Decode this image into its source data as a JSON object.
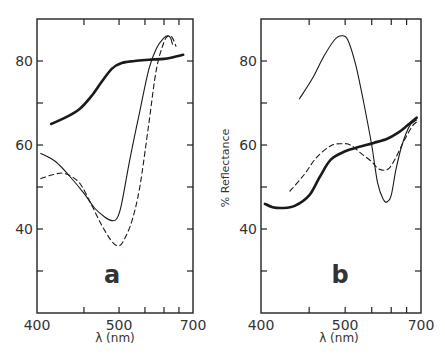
{
  "figure": {
    "ylabel": "% Reflectance",
    "xlabel": "λ (nm)"
  },
  "chart_data": [
    {
      "type": "line",
      "panel_label": "a",
      "xlabel": "λ (nm)",
      "ylabel": "",
      "x_ticks": [
        400,
        450,
        500,
        550,
        600,
        650,
        700
      ],
      "x_tick_labels": [
        "400",
        "",
        "500",
        "",
        "",
        "",
        "700"
      ],
      "x_scale_fractions": [
        0,
        0.301,
        0.526,
        0.692,
        0.814,
        0.91,
        1.0
      ],
      "y_ticks": [
        30,
        40,
        50,
        60,
        70,
        80
      ],
      "y_tick_labels": [
        "",
        "40",
        "",
        "60",
        "",
        "80"
      ],
      "ylim": [
        20,
        90
      ],
      "xlim": [
        400,
        700
      ],
      "grid": false,
      "legend": null,
      "series": [
        {
          "name": "thick-solid",
          "style": "thick",
          "points": [
            [
              415,
              65
            ],
            [
              430,
              66.5
            ],
            [
              445,
              68.5
            ],
            [
              460,
              71.5
            ],
            [
              475,
              75
            ],
            [
              490,
              78.2
            ],
            [
              505,
              79.5
            ],
            [
              530,
              80
            ],
            [
              560,
              80.3
            ],
            [
              600,
              80.5
            ],
            [
              630,
              80.9
            ],
            [
              665,
              81.5
            ]
          ]
        },
        {
          "name": "thin-solid",
          "style": "thin",
          "points": [
            [
              404,
              58
            ],
            [
              420,
              56
            ],
            [
              435,
              52.5
            ],
            [
              450,
              48.5
            ],
            [
              465,
              45
            ],
            [
              480,
              42.8
            ],
            [
              490,
              42
            ],
            [
              497,
              42.5
            ],
            [
              505,
              46
            ],
            [
              520,
              56
            ],
            [
              540,
              68
            ],
            [
              560,
              78
            ],
            [
              580,
              83
            ],
            [
              600,
              85.5
            ],
            [
              612,
              86
            ],
            [
              622,
              85.5
            ],
            [
              628,
              84
            ]
          ]
        },
        {
          "name": "dashed",
          "style": "dashed",
          "points": [
            [
              404,
              52
            ],
            [
              418,
              53
            ],
            [
              430,
              53.2
            ],
            [
              445,
              51
            ],
            [
              460,
              46
            ],
            [
              475,
              41
            ],
            [
              490,
              37
            ],
            [
              500,
              36
            ],
            [
              510,
              37.5
            ],
            [
              525,
              42
            ],
            [
              540,
              50
            ],
            [
              560,
              65
            ],
            [
              580,
              78
            ],
            [
              600,
              84.5
            ],
            [
              615,
              86
            ],
            [
              628,
              85.5
            ],
            [
              640,
              83.5
            ]
          ]
        }
      ]
    },
    {
      "type": "line",
      "panel_label": "b",
      "xlabel": "λ (nm)",
      "ylabel": "% Reflectance",
      "x_ticks": [
        400,
        450,
        500,
        550,
        600,
        650,
        700
      ],
      "x_tick_labels": [
        "400",
        "",
        "500",
        "",
        "",
        "",
        "700"
      ],
      "x_scale_fractions": [
        0,
        0.301,
        0.526,
        0.692,
        0.814,
        0.91,
        1.0
      ],
      "y_ticks": [
        30,
        40,
        50,
        60,
        70,
        80
      ],
      "y_tick_labels": [
        "",
        "40",
        "",
        "60",
        "",
        "80"
      ],
      "ylim": [
        20,
        90
      ],
      "xlim": [
        400,
        700
      ],
      "grid": false,
      "legend": null,
      "series": [
        {
          "name": "thin-solid",
          "style": "thin",
          "points": [
            [
              440,
              71
            ],
            [
              455,
              76
            ],
            [
              470,
              81
            ],
            [
              485,
              85
            ],
            [
              495,
              86
            ],
            [
              505,
              85
            ],
            [
              520,
              79
            ],
            [
              535,
              70
            ],
            [
              550,
              60
            ],
            [
              565,
              51
            ],
            [
              580,
              47
            ],
            [
              590,
              46.5
            ],
            [
              600,
              48
            ],
            [
              615,
              54
            ],
            [
              635,
              60
            ],
            [
              660,
              64.5
            ],
            [
              685,
              66
            ]
          ]
        },
        {
          "name": "thick-solid",
          "style": "thick",
          "points": [
            [
              404,
              46
            ],
            [
              412,
              45.2
            ],
            [
              422,
              45
            ],
            [
              435,
              45.5
            ],
            [
              450,
              48
            ],
            [
              465,
              52.5
            ],
            [
              480,
              56.5
            ],
            [
              500,
              58.5
            ],
            [
              525,
              59.5
            ],
            [
              555,
              60.5
            ],
            [
              590,
              61.5
            ],
            [
              620,
              62.8
            ],
            [
              650,
              64.5
            ],
            [
              685,
              66.5
            ]
          ]
        },
        {
          "name": "dashed",
          "style": "dashed",
          "points": [
            [
              430,
              49
            ],
            [
              445,
              53
            ],
            [
              460,
              57
            ],
            [
              480,
              59.8
            ],
            [
              495,
              60.3
            ],
            [
              510,
              60
            ],
            [
              530,
              58
            ],
            [
              550,
              56
            ],
            [
              565,
              54.5
            ],
            [
              580,
              54
            ],
            [
              595,
              54.5
            ],
            [
              615,
              57
            ],
            [
              645,
              61.5
            ],
            [
              670,
              64.5
            ],
            [
              685,
              65.5
            ]
          ]
        }
      ]
    }
  ]
}
